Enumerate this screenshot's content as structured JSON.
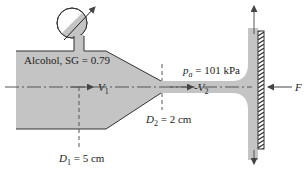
{
  "diagram": {
    "type": "fluid-mechanics-figure",
    "colors": {
      "fluid": "#c4c4c4",
      "outline": "#333333",
      "background": "#ffffff",
      "text": "#222222"
    },
    "labels": {
      "fluid": "Alcohol, SG = 0.79",
      "pressure_symbol": "p",
      "pressure_subscript": "a",
      "pressure_value": " = 101 kPa",
      "v1_symbol": "V",
      "v1_subscript": "1",
      "v2_prefix": "-",
      "v2_symbol": "V",
      "v2_subscript": "2",
      "d2_symbol": "D",
      "d2_subscript": "2",
      "d2_value": " = 2 cm",
      "d1_symbol": "D",
      "d1_subscript": "1",
      "d1_value": " = 5 cm",
      "force": "F"
    },
    "components": [
      "pressure-gauge",
      "tank",
      "nozzle",
      "jet",
      "flat-plate",
      "centerline",
      "force-arrow",
      "deflected-flow-arrows"
    ]
  }
}
